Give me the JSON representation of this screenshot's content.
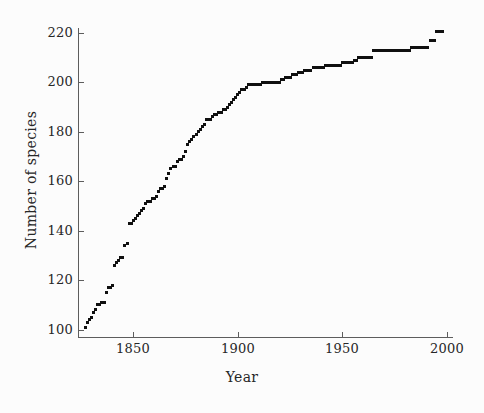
{
  "chart_data": {
    "type": "scatter",
    "title": "",
    "xlabel": "Year",
    "ylabel": "Number of species",
    "xlim": [
      1824,
      2003
    ],
    "ylim": [
      97,
      222
    ],
    "xticks": [
      1850,
      1900,
      1950,
      2000
    ],
    "xtick_labels": [
      "1850",
      "1900",
      "1950",
      "2000"
    ],
    "yticks": [
      100,
      120,
      140,
      160,
      180,
      200,
      220
    ],
    "ytick_labels": [
      "100",
      "120",
      "140",
      "160",
      "180",
      "200",
      "220"
    ],
    "grid": false,
    "legend": null,
    "marker": "square",
    "marker_color": "#101010",
    "marker_size_px": 3,
    "background_color": "#fcfcfc",
    "axis_color": "#5d5d5d",
    "text_color": "#272727",
    "x": [
      1827,
      1828,
      1829,
      1830,
      1831,
      1832,
      1833,
      1834,
      1835,
      1836,
      1837,
      1838,
      1839,
      1840,
      1841,
      1842,
      1843,
      1844,
      1845,
      1846,
      1847,
      1848,
      1849,
      1850,
      1851,
      1852,
      1853,
      1854,
      1855,
      1856,
      1857,
      1858,
      1859,
      1860,
      1861,
      1862,
      1863,
      1864,
      1865,
      1866,
      1867,
      1868,
      1869,
      1870,
      1871,
      1872,
      1873,
      1874,
      1875,
      1876,
      1877,
      1878,
      1879,
      1880,
      1881,
      1882,
      1883,
      1884,
      1885,
      1886,
      1887,
      1888,
      1889,
      1890,
      1891,
      1892,
      1893,
      1894,
      1895,
      1896,
      1897,
      1898,
      1899,
      1900,
      1901,
      1902,
      1903,
      1904,
      1905,
      1906,
      1907,
      1908,
      1909,
      1910,
      1911,
      1912,
      1913,
      1914,
      1915,
      1916,
      1917,
      1918,
      1919,
      1920,
      1921,
      1922,
      1923,
      1924,
      1925,
      1926,
      1927,
      1928,
      1929,
      1930,
      1931,
      1932,
      1933,
      1934,
      1935,
      1936,
      1937,
      1938,
      1939,
      1940,
      1941,
      1942,
      1943,
      1944,
      1945,
      1946,
      1947,
      1948,
      1949,
      1950,
      1951,
      1952,
      1953,
      1954,
      1955,
      1956,
      1957,
      1958,
      1959,
      1960,
      1961,
      1962,
      1963,
      1964,
      1965,
      1966,
      1967,
      1968,
      1969,
      1970,
      1971,
      1972,
      1973,
      1974,
      1975,
      1976,
      1977,
      1978,
      1979,
      1980,
      1981,
      1982,
      1983,
      1984,
      1985,
      1986,
      1987,
      1988,
      1989,
      1990,
      1991,
      1992,
      1993,
      1994,
      1995,
      1996,
      1997,
      1998
    ],
    "y": [
      101,
      103,
      104,
      105,
      107,
      108,
      110,
      110,
      111,
      111,
      115,
      117,
      117,
      118,
      126,
      127,
      128,
      129,
      129,
      134,
      135,
      143,
      143,
      144,
      145,
      146,
      147,
      148,
      149,
      151,
      152,
      152,
      153,
      153,
      154,
      156,
      157,
      157,
      158,
      161,
      163,
      165,
      166,
      166,
      168,
      169,
      169,
      170,
      172,
      175,
      176,
      177,
      178,
      179,
      180,
      181,
      182,
      183,
      185,
      185,
      185,
      186,
      187,
      187,
      188,
      188,
      189,
      189,
      190,
      191,
      192,
      193,
      194,
      195,
      196,
      197,
      197,
      198,
      199,
      199,
      199,
      199,
      199,
      199,
      199,
      200,
      200,
      200,
      200,
      200,
      200,
      200,
      200,
      200,
      201,
      201,
      202,
      202,
      202,
      203,
      203,
      203,
      204,
      204,
      204,
      205,
      205,
      205,
      205,
      206,
      206,
      206,
      206,
      206,
      206,
      207,
      207,
      207,
      207,
      207,
      207,
      207,
      207,
      208,
      208,
      208,
      208,
      208,
      208,
      209,
      209,
      210,
      210,
      210,
      210,
      210,
      210,
      210,
      213,
      213,
      213,
      213,
      213,
      213,
      213,
      213,
      213,
      213,
      213,
      213,
      213,
      213,
      213,
      213,
      213,
      213,
      214,
      214,
      214,
      214,
      214,
      214,
      214,
      214,
      214,
      217,
      217,
      217
    ]
  }
}
